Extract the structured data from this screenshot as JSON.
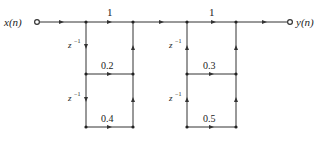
{
  "diagram": {
    "type": "signal-flow-graph",
    "input_label": "x(n)",
    "output_label": "y(n)",
    "delay_label": "z",
    "delay_exp": "−1",
    "colors": {
      "line": "#333333",
      "background": "#ffffff"
    },
    "sections": [
      {
        "name": "section-1",
        "forward_gain": "1",
        "delay_direction": "down",
        "feedback_direction": "up",
        "coefficients": [
          "0.2",
          "0.4"
        ]
      },
      {
        "name": "section-2",
        "forward_gain": "1",
        "delay_direction": "up",
        "feedback_direction": "up",
        "coefficients": [
          "0.3",
          "0.5"
        ]
      }
    ]
  }
}
